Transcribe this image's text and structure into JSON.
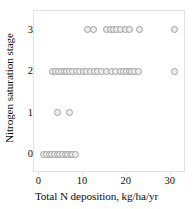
{
  "chart_data": {
    "type": "scatter",
    "title": "",
    "xlabel": "Total N deposition, kg/ha/yr",
    "ylabel": "Nitrogen saturation stage",
    "xlim": [
      -1.2,
      33.5
    ],
    "ylim": [
      -0.45,
      3.45
    ],
    "xticks": [
      0,
      10,
      20,
      30
    ],
    "xtick_labels": [
      "0",
      "10",
      "20",
      "30"
    ],
    "yticks": [
      0,
      1,
      2,
      3
    ],
    "ytick_labels": [
      "0",
      "1",
      "2",
      "3"
    ],
    "grid": false,
    "legend": null,
    "marker": {
      "shape": "circle-open",
      "face_color": "#ededed",
      "edge_color": "#9f9f9f",
      "size_px": 7
    },
    "frame_color": "#e2e2e2",
    "background": "#ffffff",
    "series": [
      {
        "name": "Nitrogen saturation stage vs total N deposition",
        "points": [
          {
            "x": 1.0,
            "y": 0
          },
          {
            "x": 1.7,
            "y": 0
          },
          {
            "x": 2.3,
            "y": 0
          },
          {
            "x": 2.9,
            "y": 0
          },
          {
            "x": 3.5,
            "y": 0
          },
          {
            "x": 4.1,
            "y": 0
          },
          {
            "x": 4.7,
            "y": 0
          },
          {
            "x": 5.3,
            "y": 0
          },
          {
            "x": 5.9,
            "y": 0
          },
          {
            "x": 6.5,
            "y": 0
          },
          {
            "x": 7.1,
            "y": 0
          },
          {
            "x": 7.7,
            "y": 0
          },
          {
            "x": 8.2,
            "y": 0
          },
          {
            "x": 4.2,
            "y": 1
          },
          {
            "x": 6.8,
            "y": 1
          },
          {
            "x": 3.1,
            "y": 2
          },
          {
            "x": 3.8,
            "y": 2
          },
          {
            "x": 4.5,
            "y": 2
          },
          {
            "x": 5.1,
            "y": 2
          },
          {
            "x": 5.7,
            "y": 2
          },
          {
            "x": 6.3,
            "y": 2
          },
          {
            "x": 6.9,
            "y": 2
          },
          {
            "x": 7.6,
            "y": 2
          },
          {
            "x": 8.4,
            "y": 2
          },
          {
            "x": 9.2,
            "y": 2
          },
          {
            "x": 10.0,
            "y": 2
          },
          {
            "x": 10.8,
            "y": 2
          },
          {
            "x": 11.6,
            "y": 2
          },
          {
            "x": 12.5,
            "y": 2
          },
          {
            "x": 13.4,
            "y": 2
          },
          {
            "x": 14.3,
            "y": 2
          },
          {
            "x": 15.4,
            "y": 2
          },
          {
            "x": 16.4,
            "y": 2
          },
          {
            "x": 17.5,
            "y": 2
          },
          {
            "x": 18.6,
            "y": 2
          },
          {
            "x": 19.3,
            "y": 2
          },
          {
            "x": 19.9,
            "y": 2
          },
          {
            "x": 20.5,
            "y": 2
          },
          {
            "x": 21.1,
            "y": 2
          },
          {
            "x": 21.8,
            "y": 2
          },
          {
            "x": 22.6,
            "y": 2
          },
          {
            "x": 30.9,
            "y": 2
          },
          {
            "x": 11.0,
            "y": 3
          },
          {
            "x": 12.3,
            "y": 3
          },
          {
            "x": 15.4,
            "y": 3
          },
          {
            "x": 16.3,
            "y": 3
          },
          {
            "x": 17.0,
            "y": 3
          },
          {
            "x": 17.7,
            "y": 3
          },
          {
            "x": 18.5,
            "y": 3
          },
          {
            "x": 19.6,
            "y": 3
          },
          {
            "x": 20.6,
            "y": 3
          },
          {
            "x": 22.9,
            "y": 3
          },
          {
            "x": 30.9,
            "y": 3
          }
        ]
      }
    ]
  }
}
